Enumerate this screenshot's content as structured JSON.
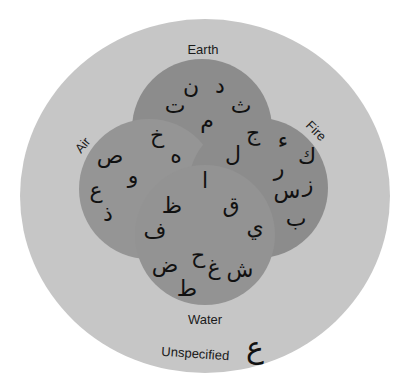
{
  "diagram": {
    "type": "venn",
    "sets": [
      {
        "name": "Earth",
        "label": "Earth"
      },
      {
        "name": "Air",
        "label": "Air"
      },
      {
        "name": "Fire",
        "label": "Fire"
      },
      {
        "name": "Water",
        "label": "Water"
      }
    ],
    "universe_label": "Unspecified",
    "colors": {
      "outer": "#c6c6c6",
      "circle": "#8e8e8e",
      "text": "#111111"
    },
    "letters": {
      "earth_only": [
        "د",
        "ن",
        "ت",
        "ث",
        "م"
      ],
      "earth_air": [
        "خ",
        "ه"
      ],
      "earth_fire": [
        "ج",
        "ل"
      ],
      "air_only": [
        "ص",
        "و",
        "ع",
        "ذ"
      ],
      "fire_only": [
        "ك",
        "ء",
        "ر",
        "ز",
        "س",
        "ب"
      ],
      "center": [
        "ا"
      ],
      "air_water": [
        "ظ",
        "ف"
      ],
      "fire_water": [
        "ق",
        "ي"
      ],
      "water_only": [
        "ح",
        "ض",
        "غ",
        "ش",
        "ط"
      ],
      "unspecified": [
        "ع"
      ]
    }
  }
}
